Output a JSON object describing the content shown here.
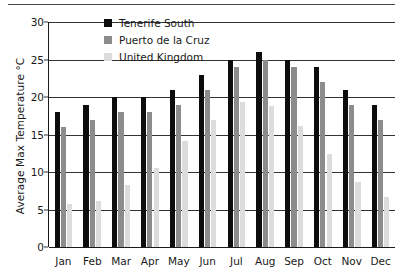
{
  "chart_data": {
    "type": "bar",
    "title": "",
    "xlabel": "",
    "ylabel": "Average Max Temperature °C",
    "categories": [
      "Jan",
      "Feb",
      "Mar",
      "Apr",
      "May",
      "Jun",
      "Jul",
      "Aug",
      "Sep",
      "Oct",
      "Nov",
      "Dec"
    ],
    "series": [
      {
        "name": "Tenerife South",
        "color": "#0d0d0d",
        "values": [
          18,
          19,
          20,
          20,
          21,
          23,
          25,
          26,
          25,
          24,
          21,
          19
        ]
      },
      {
        "name": "Puerto de la Cruz",
        "color": "#8c8c8c",
        "values": [
          16,
          17,
          18,
          18,
          19,
          21,
          24,
          25,
          24,
          22,
          19,
          17
        ]
      },
      {
        "name": "United Kingdom",
        "color": "#dcdcdc",
        "values": [
          5.7,
          6.2,
          8.3,
          10.5,
          14.2,
          16.9,
          19.3,
          18.8,
          16.1,
          12.4,
          8.7,
          6.7
        ]
      }
    ],
    "ylim": [
      0,
      30
    ],
    "yticks": [
      0,
      5,
      10,
      15,
      20,
      25,
      30
    ],
    "ytick_labels": [
      "0",
      "5",
      "10",
      "15",
      "20",
      "25",
      "30"
    ],
    "grid": true,
    "legend_position": "top-center"
  },
  "legend": {
    "entries": [
      {
        "label": "Tenerife South",
        "swatch": "legend-swatch-tenerife-south"
      },
      {
        "label": "Puerto de la Cruz",
        "swatch": "legend-swatch-puerto-de-la-cruz"
      },
      {
        "label": "United Kingdom",
        "swatch": "legend-swatch-united-kingdom"
      }
    ]
  }
}
